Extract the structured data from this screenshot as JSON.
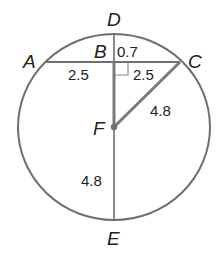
{
  "diagram": {
    "type": "circle-geometry",
    "colors": {
      "stroke": "#6e6e6e",
      "thick_stroke": "#7a7a7a",
      "text": "#222222",
      "background": "#ffffff"
    },
    "points": {
      "A": {
        "label": "A"
      },
      "B": {
        "label": "B"
      },
      "C": {
        "label": "C"
      },
      "D": {
        "label": "D"
      },
      "E": {
        "label": "E"
      },
      "F": {
        "label": "F"
      }
    },
    "measurements": {
      "BD": "0.7",
      "AB": "2.5",
      "BC": "2.5",
      "FC": "4.8",
      "FE": "4.8"
    },
    "right_angle_at": "B"
  }
}
